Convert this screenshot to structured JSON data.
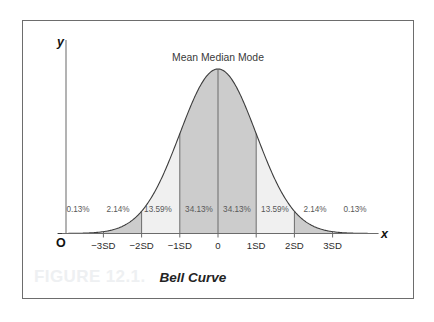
{
  "figure": {
    "number": "FIGURE 12.1.",
    "title": "Bell Curve"
  },
  "axes": {
    "y_label": "y",
    "x_label": "x",
    "origin_label": "O"
  },
  "annotations": {
    "center_label": "Mean Median Mode"
  },
  "colors": {
    "border": "#6d6d6d",
    "curve": "#3c3c3c",
    "fill_dark": "#cccccc",
    "fill_light": "#f0f0f0",
    "fill_white": "#ffffff",
    "divider": "#6b6b6b",
    "axis": "#6b6b6b",
    "figure_number": "#eef0f2",
    "text": "#2b2b2b"
  },
  "chart_data": {
    "type": "area",
    "title": "Bell Curve",
    "subtitle": "Mean Median Mode",
    "xlabel": "x",
    "ylabel": "y",
    "grid": false,
    "legend": "none",
    "distribution": "normal",
    "xlim": [
      -4.2,
      4.2
    ],
    "ylim": [
      0,
      1
    ],
    "x_ticks": [
      -3,
      -2,
      -1,
      0,
      1,
      2,
      3
    ],
    "x_tick_labels": [
      "−3SD",
      "−2SD",
      "−1SD",
      "0",
      "1SD",
      "2SD",
      "3SD"
    ],
    "bands": [
      {
        "from": -4.2,
        "to": -3,
        "percent": "0.13%",
        "shade": "white"
      },
      {
        "from": -3,
        "to": -2,
        "percent": "2.14%",
        "shade": "dark"
      },
      {
        "from": -2,
        "to": -1,
        "percent": "13.59%",
        "shade": "light"
      },
      {
        "from": -1,
        "to": 0,
        "percent": "34.13%",
        "shade": "dark"
      },
      {
        "from": 0,
        "to": 1,
        "percent": "34.13%",
        "shade": "dark"
      },
      {
        "from": 1,
        "to": 2,
        "percent": "13.59%",
        "shade": "light"
      },
      {
        "from": 2,
        "to": 3,
        "percent": "2.14%",
        "shade": "dark"
      },
      {
        "from": 3,
        "to": 4.2,
        "percent": "0.13%",
        "shade": "white"
      }
    ],
    "percent_labels": [
      "0.13%",
      "2.14%",
      "13.59%",
      "34.13%",
      "34.13%",
      "13.59%",
      "2.14%",
      "0.13%"
    ],
    "percent_label_x": [
      78,
      118,
      158,
      199,
      237,
      275,
      315,
      355
    ],
    "percent_label_y": 212
  }
}
